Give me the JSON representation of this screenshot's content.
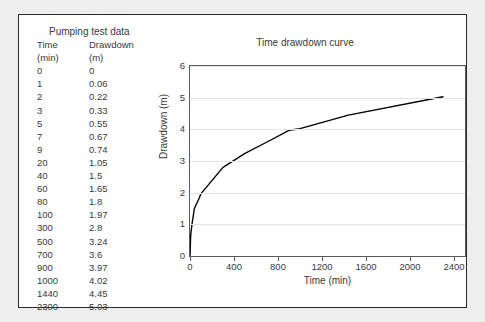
{
  "table": {
    "title": "Pumping test data",
    "headers": {
      "time": "Time",
      "time_unit": "(min)",
      "drawdown": "Drawdown",
      "drawdown_unit": "(m)"
    },
    "rows": [
      {
        "time": "0",
        "drawdown": "0"
      },
      {
        "time": "1",
        "drawdown": "0.06"
      },
      {
        "time": "2",
        "drawdown": "0.22"
      },
      {
        "time": "3",
        "drawdown": "0.33"
      },
      {
        "time": "5",
        "drawdown": "0.55"
      },
      {
        "time": "7",
        "drawdown": "0.67"
      },
      {
        "time": "9",
        "drawdown": "0.74"
      },
      {
        "time": "20",
        "drawdown": "1.05"
      },
      {
        "time": "40",
        "drawdown": "1.5"
      },
      {
        "time": "60",
        "drawdown": "1.65"
      },
      {
        "time": "80",
        "drawdown": "1.8"
      },
      {
        "time": "100",
        "drawdown": "1.97"
      },
      {
        "time": "300",
        "drawdown": "2.8"
      },
      {
        "time": "500",
        "drawdown": "3.24"
      },
      {
        "time": "700",
        "drawdown": "3.6"
      },
      {
        "time": "900",
        "drawdown": "3.97"
      },
      {
        "time": "1000",
        "drawdown": "4.02"
      },
      {
        "time": "1440",
        "drawdown": "4.45"
      },
      {
        "time": "2300",
        "drawdown": "5.03"
      }
    ]
  },
  "chart_data": {
    "type": "line",
    "title": "Time drawdown curve",
    "xlabel": "Time (min)",
    "ylabel": "Drawdown (m)",
    "xlim": [
      0,
      2500
    ],
    "ylim": [
      0,
      6
    ],
    "xticks": [
      0,
      400,
      800,
      1200,
      1600,
      2000,
      2400
    ],
    "yticks": [
      0,
      1,
      2,
      3,
      4,
      5,
      6
    ],
    "xtick_labels": [
      "0",
      "400",
      "800",
      "1200",
      "1600",
      "2000",
      "2400"
    ],
    "ytick_labels": [
      "0",
      "1",
      "2",
      "3",
      "4",
      "5",
      "6"
    ],
    "grid": "horizontal",
    "legend": "none",
    "series": [
      {
        "name": "Drawdown",
        "color": "#000000",
        "x": [
          0,
          1,
          2,
          3,
          5,
          7,
          9,
          20,
          40,
          60,
          80,
          100,
          300,
          500,
          700,
          900,
          1000,
          1440,
          2300
        ],
        "y": [
          0,
          0.06,
          0.22,
          0.33,
          0.55,
          0.67,
          0.74,
          1.05,
          1.5,
          1.65,
          1.8,
          1.97,
          2.8,
          3.24,
          3.6,
          3.97,
          4.02,
          4.45,
          5.03
        ]
      }
    ]
  },
  "colors": {
    "page_background": "#eeeeee",
    "figure_background": "#ffffff",
    "figure_border": "#2b2b2b",
    "text": "#3a3a3a",
    "gridline": "#e3e3e3",
    "axis": "#5a5a5a",
    "curve": "#000000"
  }
}
